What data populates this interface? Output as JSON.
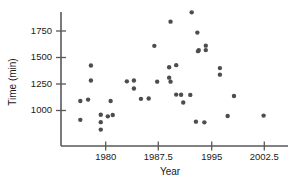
{
  "chart_data": {
    "type": "scatter",
    "title": "",
    "xlabel": "Year",
    "ylabel": "Time (min)",
    "xlim": [
      1976.0,
      2004.0
    ],
    "ylim": [
      820,
      1960
    ],
    "grid": false,
    "legend": null,
    "marker": {
      "shape": "circle",
      "color": "#4d4d4d",
      "size_px": 4.4
    },
    "xticks": [
      1980,
      1987.5,
      1995,
      2002.5
    ],
    "xtick_labels": [
      "1980",
      "1987.5",
      "1995",
      "2002.5"
    ],
    "yticks": [
      1000,
      1250,
      1500,
      1750
    ],
    "ytick_labels": [
      "1000",
      "1250",
      "1500",
      "1750"
    ],
    "n_points": 40,
    "points": [
      {
        "x": 1976.4,
        "y": 1090
      },
      {
        "x": 1976.4,
        "y": 912
      },
      {
        "x": 1977.5,
        "y": 1103
      },
      {
        "x": 1977.9,
        "y": 1425
      },
      {
        "x": 1977.9,
        "y": 1283
      },
      {
        "x": 1979.3,
        "y": 960
      },
      {
        "x": 1979.3,
        "y": 890
      },
      {
        "x": 1979.3,
        "y": 820
      },
      {
        "x": 1980.3,
        "y": 945
      },
      {
        "x": 1980.7,
        "y": 1090
      },
      {
        "x": 1981.0,
        "y": 958
      },
      {
        "x": 1983.0,
        "y": 1275
      },
      {
        "x": 1984.0,
        "y": 1283
      },
      {
        "x": 1984.0,
        "y": 1207
      },
      {
        "x": 1985.0,
        "y": 1110
      },
      {
        "x": 1986.1,
        "y": 1113
      },
      {
        "x": 1986.9,
        "y": 1610
      },
      {
        "x": 1989.0,
        "y": 1408
      },
      {
        "x": 1989.0,
        "y": 1310
      },
      {
        "x": 1989.2,
        "y": 1838
      },
      {
        "x": 1989.2,
        "y": 1272
      },
      {
        "x": 1990.0,
        "y": 1428
      },
      {
        "x": 1990.0,
        "y": 1150
      },
      {
        "x": 1990.7,
        "y": 1148
      },
      {
        "x": 1991.0,
        "y": 1075
      },
      {
        "x": 1992.0,
        "y": 1147
      },
      {
        "x": 1992.2,
        "y": 1926
      },
      {
        "x": 1992.8,
        "y": 895
      },
      {
        "x": 1993.0,
        "y": 1735
      },
      {
        "x": 1993.1,
        "y": 1560
      },
      {
        "x": 1993.2,
        "y": 1570
      },
      {
        "x": 1994.2,
        "y": 1612
      },
      {
        "x": 1994.2,
        "y": 1570
      },
      {
        "x": 1994.0,
        "y": 888
      },
      {
        "x": 1996.2,
        "y": 1400
      },
      {
        "x": 1996.2,
        "y": 1338
      },
      {
        "x": 1998.2,
        "y": 1137
      },
      {
        "x": 1997.3,
        "y": 948
      },
      {
        "x": 2002.4,
        "y": 952
      },
      {
        "x": 1987.3,
        "y": 1272
      }
    ]
  },
  "axes": {
    "y_title": "Time (min)",
    "x_title": "Year",
    "y_tick_1750": "1750",
    "y_tick_1500": "1500",
    "y_tick_1250": "1250",
    "y_tick_1000": "1000",
    "x_tick_1980": "1980",
    "x_tick_1987_5": "1987.5",
    "x_tick_1995": "1995",
    "x_tick_2002_5": "2002.5"
  },
  "colors": {
    "marker": "#4d4d4d",
    "axis": "#595959",
    "text": "#1a1a1a",
    "background": "#ffffff"
  }
}
